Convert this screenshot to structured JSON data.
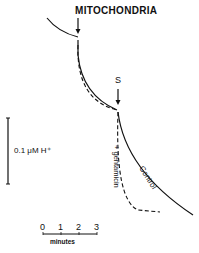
{
  "figure": {
    "additions": [
      {
        "label": "MITOCHONDRIA",
        "marker": "down-arrow"
      },
      {
        "label": "S",
        "marker": "down-arrow"
      }
    ],
    "traces": [
      {
        "name": "Control",
        "style": "solid"
      },
      {
        "name": "+ gentamicin",
        "style": "dashed"
      }
    ],
    "scale_bar_vertical": {
      "label": "0.1 μM H⁺"
    },
    "scale_bar_time": {
      "ticks": [
        "0",
        "1",
        "2",
        "3"
      ],
      "label": "minutes"
    },
    "caption_fragment": "Figure ... (caption cut off)"
  },
  "colors": {
    "ink": "#111111",
    "background": "#ffffff"
  }
}
